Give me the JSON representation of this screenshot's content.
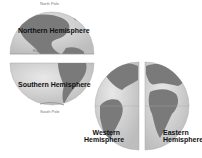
{
  "diagram": {
    "labels": {
      "north_pole": "North Pole",
      "northern": "Northern Hemisphere",
      "equator": "Equator",
      "southern": "Southern Hemisphere",
      "south_pole": "South Pole",
      "western_1": "Western",
      "western_2": "Hemisphere",
      "eastern_1": "Eastern",
      "eastern_2": "Hemisphere"
    },
    "colors": {
      "ocean": "#d6d6d6",
      "land": "#7a7a7a",
      "grid": "#b0b0b0"
    }
  }
}
